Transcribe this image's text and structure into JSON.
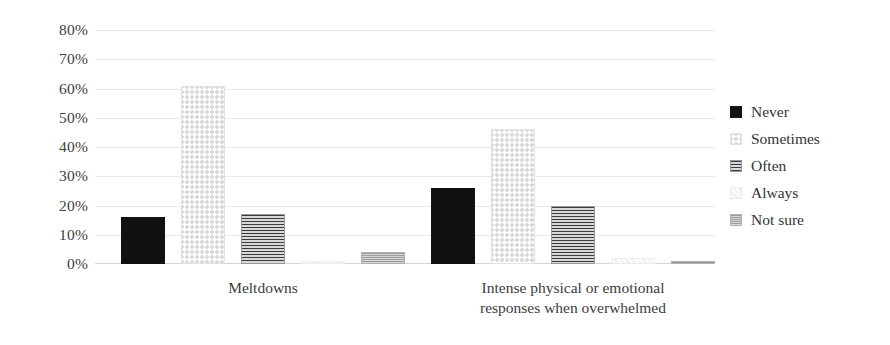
{
  "chart_data": {
    "type": "bar",
    "title": "",
    "subtitle": "",
    "xlabel": "",
    "ylabel": "",
    "ylim": [
      0,
      80
    ],
    "ytick_labels": [
      "80%",
      "70%",
      "60%",
      "50%",
      "40%",
      "30%",
      "20%",
      "10%",
      "0%"
    ],
    "ytick_values": [
      80,
      70,
      60,
      50,
      40,
      30,
      20,
      10,
      0
    ],
    "grid": true,
    "grid_axis": "y",
    "legend_position": "right",
    "categories": [
      "Meltdowns",
      "Intense physical or emotional responses when overwhelmed"
    ],
    "category_lines": [
      [
        "Meltdowns"
      ],
      [
        "Intense physical or emotional",
        "responses when overwhelmed"
      ]
    ],
    "series": [
      {
        "name": "Never",
        "values": [
          16,
          26
        ],
        "pattern": "solid-black",
        "swatch_color": "#111111"
      },
      {
        "name": "Sometimes",
        "values": [
          61,
          46
        ],
        "pattern": "light-dots",
        "swatch_color": "#e4e4e4"
      },
      {
        "name": "Often",
        "values": [
          17,
          20
        ],
        "pattern": "horizontal-lines",
        "swatch_color": "#8d8d8d"
      },
      {
        "name": "Always",
        "values": [
          1,
          2
        ],
        "pattern": "very-light",
        "swatch_color": "#f2f2f2"
      },
      {
        "name": "Not sure",
        "values": [
          4,
          1
        ],
        "pattern": "medium-gray-dots",
        "swatch_color": "#bdbdbd"
      }
    ]
  },
  "colors": {
    "background": "#ffffff",
    "text": "#3a3a3a",
    "gridline": "#e9e9e9",
    "baseline": "#d5d5d5"
  }
}
